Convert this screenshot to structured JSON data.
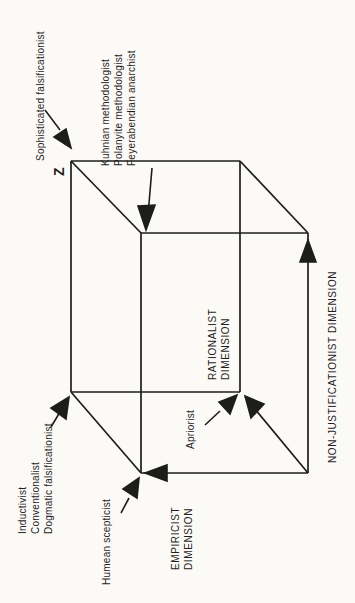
{
  "figure": {
    "corner_label": "Z",
    "labels": {
      "sophisticated": "Sophisticated falsificationist",
      "kuhnian_lines": [
        "Kuhnian methodologist",
        "Polanyite methodologist",
        "Feyerabendian anarchist"
      ],
      "inductivist_lines": [
        "Inductivist",
        "Conventionalist",
        "Dogmatic falsificationist"
      ],
      "humean": "Humean scepticist",
      "apriorist": "Apriorist"
    },
    "axes": {
      "empiricist_lines": [
        "EMPIRICIST",
        "DIMENSION"
      ],
      "rationalist_lines": [
        "RATIONALIST",
        "DIMENSION"
      ],
      "non_justificationist": "NON-JUSTIFICATIONIST DIMENSION"
    },
    "colors": {
      "ink": "#1d1d1b",
      "paper": "#fbfaf7"
    }
  }
}
